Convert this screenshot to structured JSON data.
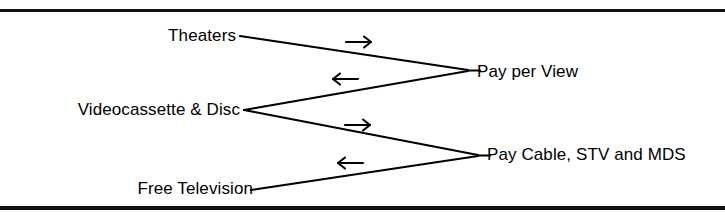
{
  "figure": {
    "background_color": "#ffffff",
    "ink_color": "#000000",
    "frame": {
      "style": "horizontal-rules-only",
      "top_rule": true,
      "bottom_rule": true,
      "side_rules": false
    }
  },
  "nodes": {
    "theaters": {
      "label": "Theaters",
      "side": "left"
    },
    "videocassette": {
      "label": "Videocassette & Disc",
      "side": "left"
    },
    "free_television": {
      "label": "Free Television",
      "side": "left"
    },
    "pay_per_view": {
      "label": "Pay per View",
      "side": "right"
    },
    "pay_cable": {
      "label": "Pay Cable, STV and MDS",
      "side": "right"
    }
  },
  "connectors": [
    {
      "name": "theaters-to-pay-per-view",
      "from": "Theaters",
      "to": "Pay per View",
      "direction": "right",
      "arrow_glyph": "arrow-right"
    },
    {
      "name": "videocassette-to-pay-per-view",
      "from": "Videocassette & Disc",
      "to": "Pay per View",
      "direction": "left",
      "arrow_glyph": "arrow-left"
    },
    {
      "name": "videocassette-to-pay-cable",
      "from": "Videocassette & Disc",
      "to": "Pay Cable, STV and MDS",
      "direction": "right",
      "arrow_glyph": "arrow-right"
    },
    {
      "name": "free-television-to-pay-cable",
      "from": "Free Television",
      "to": "Pay Cable, STV and MDS",
      "direction": "left",
      "arrow_glyph": "arrow-left"
    }
  ]
}
